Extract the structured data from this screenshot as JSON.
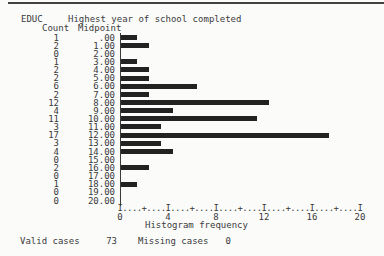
{
  "header": {
    "variable": "EDUC",
    "variable_label": "Highest year of school completed",
    "count_col": "Count",
    "midpoint_col": "Midpoint"
  },
  "chart_data": {
    "type": "bar",
    "orientation": "horizontal",
    "title": "Highest year of school completed",
    "xlabel": "Histogram frequency",
    "ylabel": "Midpoint",
    "xlim": [
      0,
      20
    ],
    "xticks": [
      "0",
      "4",
      "8",
      "12",
      "16",
      "20"
    ],
    "axis_ruler": "I....+....I....+....I....+....I....+....I....+....I",
    "categories": [
      ".00",
      "1.00",
      "2.00",
      "3.00",
      "4.00",
      "5.00",
      "6.00",
      "7.00",
      "8.00",
      "9.00",
      "10.00",
      "11.00",
      "12.00",
      "13.00",
      "14.00",
      "15.00",
      "16.00",
      "17.00",
      "18.00",
      "19.00",
      "20.00"
    ],
    "values": [
      1,
      2,
      0,
      1,
      2,
      2,
      6,
      2,
      12,
      4,
      11,
      3,
      17,
      3,
      4,
      0,
      2,
      0,
      1,
      0,
      0
    ],
    "bar_color": "#222222"
  },
  "footer": {
    "valid_label": "Valid cases",
    "valid_value": "73",
    "missing_label": "Missing cases",
    "missing_value": "0"
  }
}
